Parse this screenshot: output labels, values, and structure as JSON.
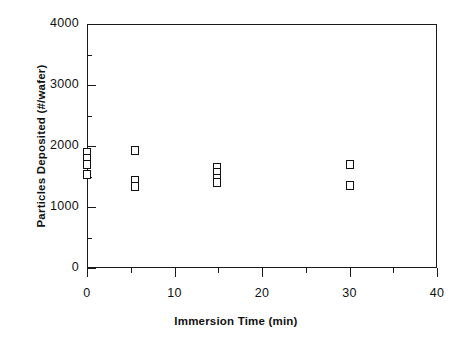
{
  "chart_data": {
    "type": "scatter",
    "title": "",
    "xlabel": "Immersion Time (min)",
    "ylabel": "Particles Deposited (#/wafer)",
    "xlim": [
      0,
      40
    ],
    "ylim": [
      0,
      4000
    ],
    "xticks": [
      0,
      10,
      20,
      30,
      40
    ],
    "xtick_labels": [
      "0",
      "10",
      "20",
      "30",
      "40"
    ],
    "xminor_ticks": [
      5,
      15,
      25,
      35
    ],
    "yticks": [
      0,
      1000,
      2000,
      3000,
      4000
    ],
    "ytick_labels": [
      "0",
      "1000",
      "2000",
      "3000",
      "4000"
    ],
    "yminor_ticks": [
      500,
      1500,
      2500,
      3500
    ],
    "grid": false,
    "legend": null,
    "marker": "open-square",
    "marker_color": "#111111",
    "series": [
      {
        "name": "Particles Deposited",
        "points": [
          {
            "x": 0.0,
            "y": 1890
          },
          {
            "x": 0.0,
            "y": 1790
          },
          {
            "x": 0.0,
            "y": 1700
          },
          {
            "x": 0.0,
            "y": 1530
          },
          {
            "x": 5.5,
            "y": 1930
          },
          {
            "x": 5.5,
            "y": 1430
          },
          {
            "x": 5.5,
            "y": 1340
          },
          {
            "x": 14.8,
            "y": 1640
          },
          {
            "x": 14.8,
            "y": 1560
          },
          {
            "x": 14.8,
            "y": 1460
          },
          {
            "x": 14.8,
            "y": 1400
          },
          {
            "x": 30.0,
            "y": 1700
          },
          {
            "x": 30.0,
            "y": 1350
          }
        ]
      }
    ]
  }
}
